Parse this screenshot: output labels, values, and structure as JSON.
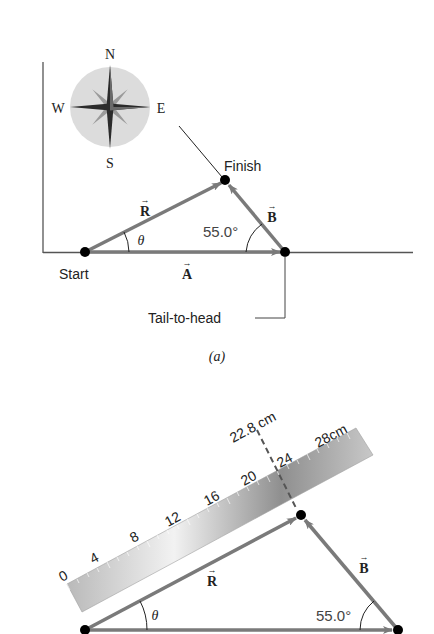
{
  "figure_a": {
    "caption": "(a)",
    "compass": {
      "north": "N",
      "south": "S",
      "east": "E",
      "west": "W"
    },
    "labels": {
      "start": "Start",
      "finish": "Finish",
      "vector_r": "R",
      "vector_a": "A",
      "vector_b": "B",
      "theta": "θ",
      "angle": "55.0°",
      "tail_to_head": "Tail-to-head"
    }
  },
  "figure_b": {
    "ruler": {
      "ticks": [
        "0",
        "4",
        "8",
        "12",
        "16",
        "20",
        "24",
        "28cm"
      ],
      "measurement": "22.8 cm"
    },
    "labels": {
      "vector_r": "R",
      "vector_b": "B",
      "theta": "θ",
      "angle": "55.0°"
    }
  },
  "colors": {
    "vector": "#7a7a7a",
    "axis": "#555555",
    "dot": "#000000",
    "compass_bg": "#dcdcdc"
  }
}
